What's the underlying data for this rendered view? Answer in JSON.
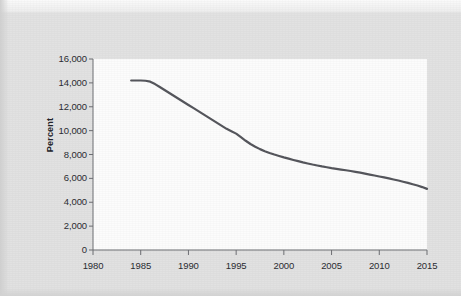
{
  "page": {
    "background_color": "#e2e2e2",
    "plot_background_color": "#fcfcfc",
    "watermark_text": ""
  },
  "chart_data": {
    "type": "line",
    "title": "",
    "subtitle": "",
    "xlabel": "",
    "ylabel": "Percent",
    "xlim": [
      1980,
      2015
    ],
    "ylim": [
      0,
      16000
    ],
    "grid": false,
    "legend": false,
    "legend_position": "none",
    "line_color": "#55565c",
    "line_width": 2.2,
    "x_ticks": [
      1980,
      1985,
      1990,
      1995,
      2000,
      2005,
      2010,
      2015
    ],
    "x_tick_labels": [
      "1980",
      "1985",
      "1990",
      "1995",
      "2000",
      "2005",
      "2010",
      "2015"
    ],
    "y_ticks": [
      0,
      2000,
      4000,
      6000,
      8000,
      10000,
      12000,
      14000,
      16000
    ],
    "y_tick_labels": [
      "0",
      "2,000",
      "4,000",
      "6,000",
      "8,000",
      "10,000",
      "12,000",
      "14,000",
      "16,000"
    ],
    "series": [
      {
        "name": "Percent",
        "x": [
          1984.0,
          1984.5,
          1985.0,
          1985.5,
          1986.0,
          1986.5,
          1987.0,
          1987.5,
          1988.0,
          1988.5,
          1989.0,
          1989.5,
          1990.0,
          1990.5,
          1991.0,
          1991.5,
          1992.0,
          1992.5,
          1993.0,
          1993.5,
          1994.0,
          1994.5,
          1995.0,
          1995.5,
          1996.0,
          1996.5,
          1997.0,
          1997.5,
          1998.0,
          1998.5,
          1999.0,
          1999.5,
          2000.0,
          2000.5,
          2001.0,
          2001.5,
          2002.0,
          2002.5,
          2003.0,
          2003.5,
          2004.0,
          2004.5,
          2005.0,
          2005.5,
          2006.0,
          2006.5,
          2007.0,
          2007.5,
          2008.0,
          2008.5,
          2009.0,
          2009.5,
          2010.0,
          2010.5,
          2011.0,
          2011.5,
          2012.0,
          2012.5,
          2013.0,
          2013.5,
          2014.0,
          2014.5,
          2015.0
        ],
        "y": [
          14200,
          14200,
          14200,
          14180,
          14100,
          13900,
          13650,
          13400,
          13150,
          12900,
          12650,
          12400,
          12150,
          11900,
          11650,
          11400,
          11150,
          10900,
          10650,
          10400,
          10150,
          9950,
          9750,
          9450,
          9150,
          8880,
          8650,
          8450,
          8280,
          8130,
          8000,
          7880,
          7760,
          7650,
          7540,
          7440,
          7340,
          7250,
          7160,
          7080,
          7000,
          6930,
          6860,
          6800,
          6740,
          6680,
          6620,
          6550,
          6480,
          6400,
          6320,
          6240,
          6160,
          6080,
          6000,
          5910,
          5820,
          5720,
          5620,
          5510,
          5400,
          5270,
          5120
        ]
      }
    ]
  }
}
